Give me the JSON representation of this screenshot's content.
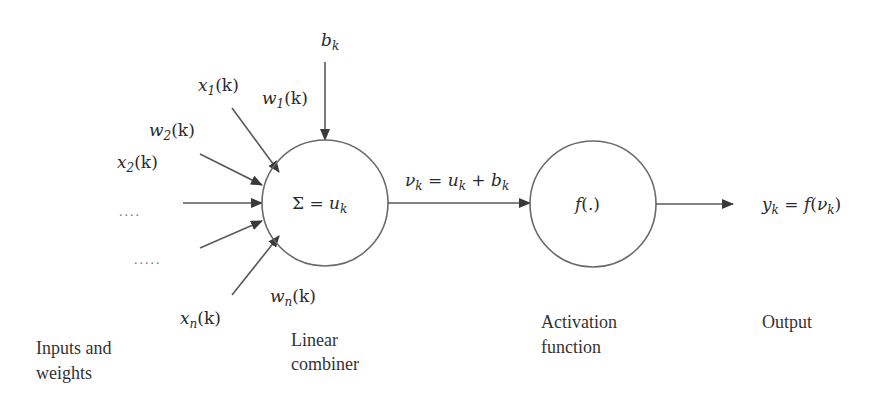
{
  "diagram": {
    "colors": {
      "stroke": "#6a6a6a",
      "text": "#2a2a2a",
      "background": "#ffffff"
    },
    "inputs": {
      "x1": {
        "base": "x",
        "sub": "1",
        "arg": "(k)"
      },
      "w1": {
        "base": "w",
        "sub": "1",
        "arg": "(k)"
      },
      "w2": {
        "base": "w",
        "sub": "2",
        "arg": "(k)"
      },
      "x2": {
        "base": "x",
        "sub": "2",
        "arg": "(k)"
      },
      "wn": {
        "base": "w",
        "sub": "n",
        "arg": "(k)"
      },
      "xn": {
        "base": "x",
        "sub": "n",
        "arg": "(k)"
      },
      "dots_upper": "....",
      "dots_lower": "....."
    },
    "bias": {
      "base": "b",
      "sub": "k"
    },
    "combiner": {
      "sigma": "Σ",
      "eq": " = ",
      "base": "u",
      "sub": "k"
    },
    "induced_field": {
      "v": "ν",
      "v_sub": "k",
      "eq": " = ",
      "u": "u",
      "u_sub": "k",
      "plus": " + ",
      "b": "b",
      "b_sub": "k"
    },
    "activation": {
      "label": "f",
      "arg": "(.)"
    },
    "output": {
      "y": "y",
      "y_sub": "k",
      "eq": " = ",
      "f": "f",
      "open": "(",
      "v": "ν",
      "v_sub": "k",
      "close": ")"
    },
    "captions": {
      "inputs_line1": "Inputs and",
      "inputs_line2": "weights",
      "combiner_line1": "Linear",
      "combiner_line2": "combiner",
      "activation_line1": "Activation",
      "activation_line2": "function",
      "output": "Output"
    }
  }
}
